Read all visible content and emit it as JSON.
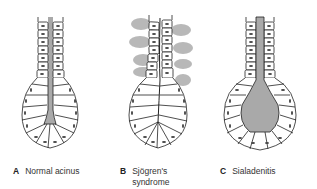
{
  "figure": {
    "panels": [
      {
        "letter": "A",
        "label": "Normal acinus",
        "label_line2": ""
      },
      {
        "letter": "B",
        "label": "Sjögren's",
        "label_line2": "syndrome"
      },
      {
        "letter": "C",
        "label": "Sialadenitis",
        "label_line2": ""
      }
    ],
    "colors": {
      "lumen": "#a9a9a9",
      "infiltrate": "#b8b8b8",
      "outline": "#222222",
      "nucleus": "#444444"
    }
  }
}
